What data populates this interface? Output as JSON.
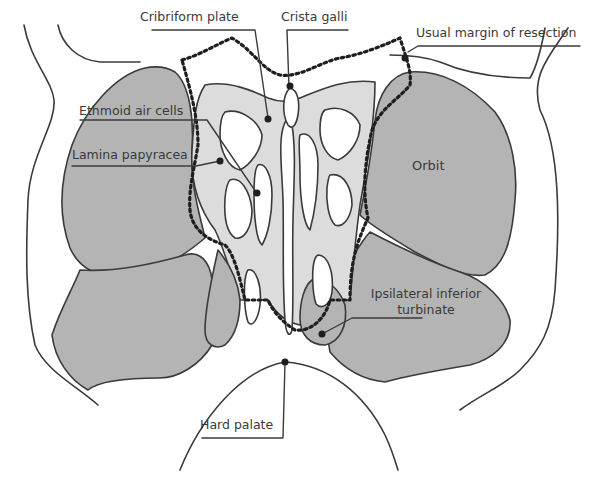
{
  "figure": {
    "colors": {
      "background": "#ffffff",
      "dark_fill": "#b4b4b4",
      "light_fill": "#dcdcdc",
      "outline": "#3a3a3a",
      "resection_margin": "#1e1e1e",
      "label_text": "#3a3a3a"
    },
    "labels": {
      "cribriform_plate": "Cribriform plate",
      "crista_galli": "Crista galli",
      "usual_margin": "Usual margin of resection",
      "ethmoid_air_cells": "Ethmoid air cells",
      "lamina_papyracea": "Lamina papyracea",
      "orbit": "Orbit",
      "inferior_turbinate_line1": "Ipsilateral inferior",
      "inferior_turbinate_line2": "turbinate",
      "hard_palate": "Hard palate"
    }
  }
}
